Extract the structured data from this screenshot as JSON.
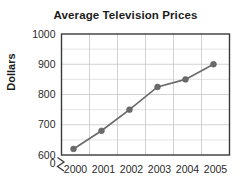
{
  "chart_data": {
    "type": "line",
    "title": "Average Television Prices",
    "xlabel": "",
    "ylabel": "Dollars",
    "categories": [
      "2000",
      "2001",
      "2002",
      "2003",
      "2004",
      "2005"
    ],
    "x": [
      2000,
      2001,
      2002,
      2003,
      2004,
      2005
    ],
    "values": [
      620,
      680,
      750,
      825,
      850,
      900
    ],
    "series": [
      {
        "name": "Average Television Price",
        "values": [
          620,
          680,
          750,
          825,
          850,
          900
        ]
      }
    ],
    "ylim": [
      600,
      1000
    ],
    "y_ticks": [
      600,
      700,
      800,
      900,
      1000
    ],
    "y_tick_labels": [
      "600",
      "700",
      "800",
      "900",
      "1000"
    ],
    "y_minor_step": 50,
    "y_axis_break": true,
    "y_axis_origin_label": "0",
    "x_tick_labels": [
      "2000",
      "2001",
      "2002",
      "2003",
      "2004",
      "2005"
    ],
    "grid": true,
    "legend": false,
    "legend_position": "none",
    "marker": "circle",
    "colors": {
      "line": "#6b6b6b",
      "marker": "#6b6b6b",
      "grid_minor": "#d8d8d8",
      "grid_major": "#c6c6c6",
      "border": "#3a3a3a",
      "text": "#1b1b1b",
      "background": "#ffffff"
    }
  }
}
